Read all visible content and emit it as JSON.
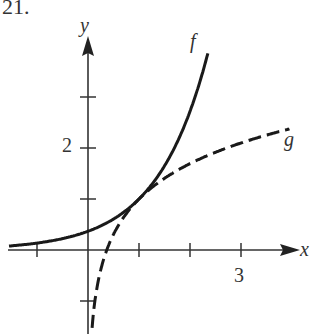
{
  "problem_number": "21.",
  "chart_data": {
    "type": "line",
    "title": "",
    "xlabel": "x",
    "ylabel": "y",
    "xlim": [
      -1.55,
      4.2
    ],
    "ylim": [
      -1.6,
      4.2
    ],
    "x_ticks": [
      -1,
      1,
      2,
      3
    ],
    "x_tick_labels": {
      "3": "3"
    },
    "y_ticks": [
      -1,
      1,
      2,
      3
    ],
    "y_tick_labels": {
      "2": "2"
    },
    "grid": false,
    "series": [
      {
        "name": "f",
        "style": "solid",
        "formula": "e^(x-1)",
        "x": [
          -1.55,
          -1,
          0,
          0.5,
          1,
          1.5,
          2,
          2.37
        ],
        "y": [
          0.08,
          0.14,
          0.37,
          0.61,
          1.0,
          1.65,
          2.72,
          3.94
        ]
      },
      {
        "name": "g",
        "style": "dashed",
        "formula": "1 + ln(x)",
        "x": [
          0.08,
          0.2,
          0.5,
          1,
          2,
          3,
          3.95
        ],
        "y": [
          -1.53,
          -0.61,
          0.31,
          1.0,
          1.69,
          2.1,
          2.37
        ]
      }
    ],
    "annotations": [
      {
        "text": "f",
        "near": "end of solid curve"
      },
      {
        "text": "g",
        "near": "end of dashed curve"
      }
    ]
  }
}
